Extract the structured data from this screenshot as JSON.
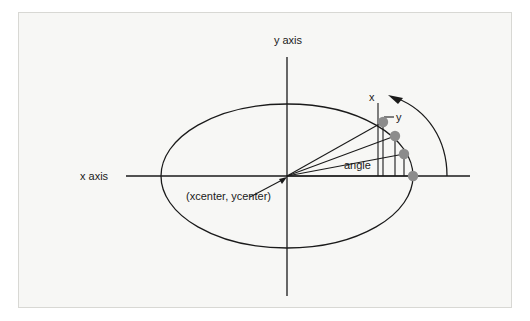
{
  "figure": {
    "kind": "geometry-diagram",
    "background_color": "#f7f7f5",
    "border_color": "#d8d8d4",
    "line_color": "#1a1a1a",
    "marker_color": "#8c8c8c"
  },
  "labels": {
    "y_axis": "y axis",
    "x_axis": "x axis",
    "center": "(xcenter, ycenter)",
    "angle": "angle",
    "x_component": "x",
    "y_component": "y"
  },
  "geometry": {
    "center": {
      "x": 287,
      "y": 176
    },
    "ellipse": {
      "cx": 287,
      "cy": 176,
      "rx": 126,
      "ry": 72
    },
    "x_axis_line": {
      "x1": 126,
      "y1": 176,
      "x2": 470,
      "y2": 176
    },
    "y_axis_line": {
      "x1": 287,
      "y1": 57,
      "x2": 287,
      "y2": 296
    },
    "points": [
      {
        "x": 383,
        "y": 122
      },
      {
        "x": 395,
        "y": 136
      },
      {
        "x": 404,
        "y": 154
      },
      {
        "x": 413,
        "y": 176
      }
    ],
    "marker_radius": 5,
    "x_component_guide": {
      "x": 378,
      "y_top": 103,
      "y_bottom": 176
    },
    "rotation_arc": {
      "start": {
        "x": 447,
        "y": 176
      },
      "end": {
        "x": 393,
        "y": 97
      },
      "direction": "counter-clockwise"
    },
    "center_leader": {
      "x1": 252,
      "y1": 196,
      "x2": 283,
      "y2": 179
    },
    "y_leader": {
      "x1": 383,
      "y1": 118,
      "x2": 393,
      "y2": 116
    }
  },
  "label_positions": {
    "y_axis": {
      "x": 288,
      "y": 44
    },
    "x_axis": {
      "x": 80,
      "y": 176
    },
    "center": {
      "x": 186,
      "y": 200
    },
    "angle": {
      "x": 344,
      "y": 168
    },
    "x_component": {
      "x": 369,
      "y": 101
    },
    "y_component": {
      "x": 397,
      "y": 120
    }
  }
}
